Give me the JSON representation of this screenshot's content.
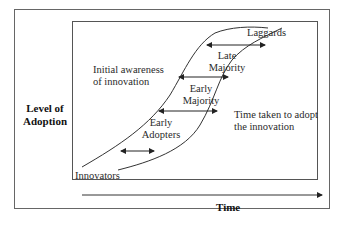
{
  "diagram": {
    "y_axis_label": [
      "Level of",
      "Adoption"
    ],
    "x_axis_label": "Time",
    "stages": [
      {
        "label": [
          "Innovators"
        ]
      },
      {
        "label": [
          "Early",
          "Adopters"
        ]
      },
      {
        "label": [
          "Early",
          "Majority"
        ]
      },
      {
        "label": [
          "Late",
          "Majority"
        ]
      },
      {
        "label": [
          "Laggards"
        ]
      }
    ],
    "annotations": {
      "initial_awareness": [
        "Initial awareness",
        "of innovation"
      ],
      "time_taken": [
        "Time taken to adopt",
        "the innovation"
      ]
    },
    "colors": {
      "line": "#333333",
      "frame": "#666666"
    }
  }
}
